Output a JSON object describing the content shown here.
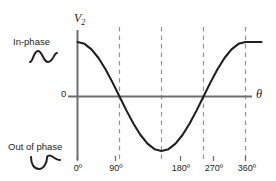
{
  "figure": {
    "background_color": "#ffffff",
    "ink_color": "#231f20",
    "axis_color": "#6d6e71",
    "grid_color": "#929497"
  },
  "axes": {
    "y_axis_label": "V",
    "y_axis_subscript": "2",
    "x_axis_label": "θ",
    "zero_label": "0",
    "x_ticks": [
      "0º",
      "90º",
      "180º",
      "270º",
      "360º"
    ]
  },
  "annotations": {
    "in_phase": "In-phase",
    "in_phase_glyph": "sine-wave-icon",
    "out_of_phase": "Out of phase",
    "out_of_phase_glyph": "inverted-sine-wave-icon"
  },
  "chart_data": {
    "type": "line",
    "title": "",
    "xlabel": "θ",
    "ylabel": "V2",
    "xlim": [
      0,
      360
    ],
    "ylim": [
      -1,
      1
    ],
    "grid": true,
    "grid_lines_at_x": [
      90,
      180,
      270,
      360
    ],
    "legend_position": "none",
    "series": [
      {
        "name": "V2 = cos(θ)",
        "x": [
          0,
          15,
          30,
          45,
          60,
          75,
          90,
          105,
          120,
          135,
          150,
          165,
          180,
          195,
          210,
          225,
          240,
          255,
          270,
          285,
          300,
          315,
          330,
          345,
          360
        ],
        "values": [
          1.0,
          0.966,
          0.866,
          0.707,
          0.5,
          0.259,
          0.0,
          -0.259,
          -0.5,
          -0.707,
          -0.866,
          -0.966,
          -1.0,
          -0.966,
          -0.866,
          -0.707,
          -0.5,
          -0.259,
          0.0,
          0.259,
          0.5,
          0.707,
          0.866,
          0.966,
          1.0
        ]
      }
    ],
    "key_points": [
      {
        "x": 0,
        "y": 1.0,
        "note": "maximum / in-phase"
      },
      {
        "x": 90,
        "y": 0.0,
        "note": "zero crossing"
      },
      {
        "x": 180,
        "y": -1.0,
        "note": "minimum / out of phase"
      },
      {
        "x": 270,
        "y": 0.0,
        "note": "zero crossing"
      },
      {
        "x": 360,
        "y": 1.0,
        "note": "maximum / in-phase"
      }
    ]
  }
}
